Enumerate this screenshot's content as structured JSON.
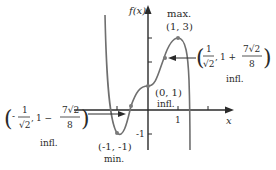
{
  "diagram": {
    "type": "function-graph",
    "axes": {
      "y_label": "f(x)",
      "x_label": "x",
      "x_tick_labels": [
        "1"
      ],
      "y_tick_labels": [
        "-1"
      ]
    },
    "points": [
      {
        "id": "max",
        "coords_label": "(1, 3)",
        "kind_label": "max.",
        "x": 1,
        "y": 3
      },
      {
        "id": "inflection-origin",
        "coords_label": "(0, 1)",
        "kind_label": "infl.",
        "x": 0,
        "y": 1
      },
      {
        "id": "min",
        "coords_label": "(-1, -1)",
        "kind_label": "min.",
        "x": -1,
        "y": -1
      },
      {
        "id": "inflection-right",
        "kind_label": "infl.",
        "x_num": "1",
        "x_den": "√2",
        "y_prefix": "1 +",
        "y_num": "7√2",
        "y_den": "8",
        "open": "(",
        "close": ")",
        "sep": ","
      },
      {
        "id": "inflection-left",
        "kind_label": "infl.",
        "x_sign": "-",
        "x_num": "1",
        "x_den": "√2",
        "y_prefix": "1 −",
        "y_num": "7√2",
        "y_den": "8",
        "open": "(",
        "close": ")",
        "sep": ","
      }
    ],
    "colors": {
      "curve": "#6f6f6f",
      "axis": "#2a2a2a",
      "text": "#2a2a2a",
      "point": "#7a7a7a"
    }
  }
}
